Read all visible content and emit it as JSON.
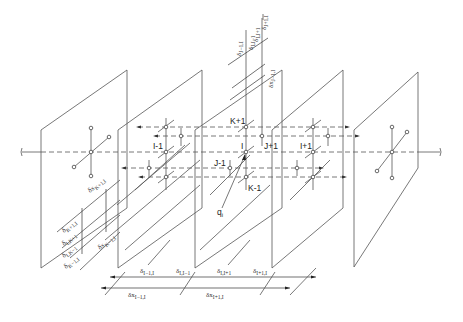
{
  "diagram": {
    "title": "",
    "panels_count": 5,
    "node_labels": {
      "k_plus": "K+1",
      "k_minus": "K-1",
      "j_plus": "J+1",
      "j_minus": "J-1",
      "i": "I",
      "i_plus": "I+1",
      "i_minus": "I-1",
      "source": "q",
      "source_sub": "i"
    },
    "dims_bottom": {
      "d1": "δ",
      "d1_sub": "I−1,I",
      "d2": "δ",
      "d2_sub": "I,I−1",
      "d3": "δ",
      "d3_sub": "I,I+1",
      "d4": "δ",
      "d4_sub": "I+1,I",
      "dx1": "δx",
      "dx1_sub": "I−1,I",
      "dx2": "δx",
      "dx2_sub": "I+1,I"
    },
    "dims_left": {
      "a": "δ",
      "a_sub": "K+1,I",
      "b": "δ",
      "b_sub": "I,K+1",
      "c": "δ",
      "c_sub": "I,K−1",
      "d": "δ",
      "d_sub": "K−1,I",
      "dk_plus": "δx",
      "dk_plus_sub": "K+1,I",
      "dk_minus": "δx",
      "dk_minus_sub": "K−1,I"
    },
    "dims_top": {
      "a": "δ",
      "a_sub": "J−1,I",
      "b": "δ",
      "b_sub": "I,J−1",
      "c": "δ",
      "c_sub": "I,J+1",
      "d": "δ",
      "d_sub": "J+1,I",
      "dj": "δx",
      "dj_sub": "J−1,I"
    },
    "colors": {
      "line": "#555555",
      "text": "#222222",
      "background": "#ffffff"
    }
  }
}
